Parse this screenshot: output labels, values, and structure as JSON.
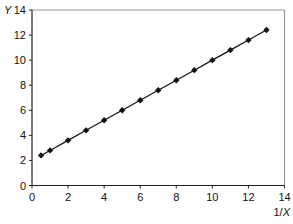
{
  "chart_data": {
    "type": "line",
    "title": "",
    "xlabel": "1/X",
    "ylabel": "Y",
    "xlim": [
      0,
      14
    ],
    "ylim": [
      0,
      14
    ],
    "xticks": [
      0,
      2,
      4,
      6,
      8,
      10,
      12,
      14
    ],
    "yticks": [
      0,
      2,
      4,
      6,
      8,
      10,
      12,
      14
    ],
    "grid": false,
    "legend": null,
    "series": [
      {
        "name": "Y vs 1/X",
        "marker": "diamond",
        "line": "linear fit",
        "color": "#111111",
        "x": [
          0.5,
          1,
          2,
          3,
          4,
          5,
          6,
          7,
          8,
          9,
          10,
          11,
          12,
          13
        ],
        "y": [
          2.4,
          2.8,
          3.6,
          4.4,
          5.2,
          6.0,
          6.8,
          7.6,
          8.4,
          9.2,
          10.0,
          10.8,
          11.6,
          12.4
        ]
      }
    ]
  },
  "labels": {
    "y_axis": "Y",
    "x_axis_prefix": "1/",
    "x_axis_var": "X"
  },
  "colors": {
    "axis": "#222222",
    "frame": "#9a9a9a",
    "series": "#111111"
  }
}
